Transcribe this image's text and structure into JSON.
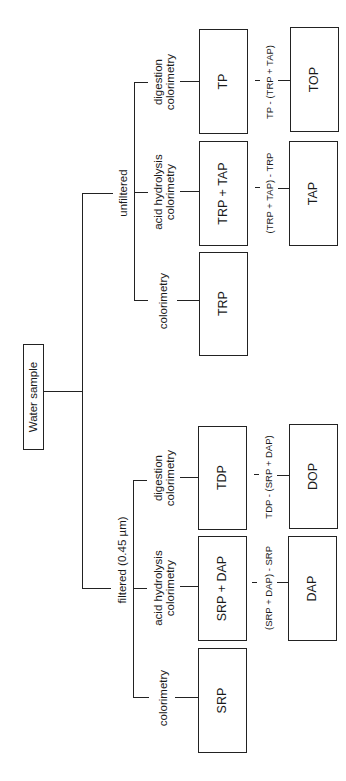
{
  "diagram": {
    "root": {
      "label": "Water sample"
    },
    "branches": [
      {
        "id": "unfiltered",
        "label": "unfiltered",
        "methods": [
          {
            "method": "colorimetry",
            "measured": "TRP",
            "derived": null,
            "formula": null
          },
          {
            "method": "acid hydrolysis colorimetry",
            "method_lines": [
              "acid hydrolysis",
              "colorimetry"
            ],
            "measured": "TRP + TAP",
            "formula": "(TRP + TAP) - TRP",
            "derived": "TAP"
          },
          {
            "method": "digestion colorimetry",
            "method_lines": [
              "digestion",
              "colorimetry"
            ],
            "measured": "TP",
            "formula": "TP - (TRP + TAP)",
            "derived": "TOP"
          }
        ]
      },
      {
        "id": "filtered",
        "label": "filtered (0.45 µm)",
        "methods": [
          {
            "method": "colorimetry",
            "measured": "SRP",
            "derived": null,
            "formula": null
          },
          {
            "method": "acid hydrolysis colorimetry",
            "method_lines": [
              "acid hydrolysis",
              "colorimetry"
            ],
            "measured": "SRP + DAP",
            "formula": "(SRP + DAP) - SRP",
            "derived": "DAP"
          },
          {
            "method": "digestion colorimetry",
            "method_lines": [
              "digestion",
              "colorimetry"
            ],
            "measured": "TDP",
            "formula": "TDP - (SRP + DAP)",
            "derived": "DOP"
          }
        ]
      }
    ],
    "orientation": "rotated 90° counter-clockwise",
    "line_color": "#222222"
  }
}
